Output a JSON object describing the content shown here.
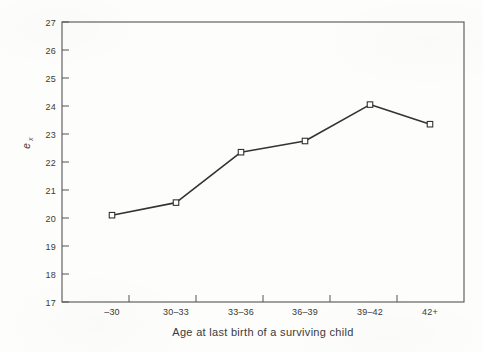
{
  "chart_data": {
    "type": "line",
    "title": "",
    "subtitle": "",
    "xlabel": "Age at last birth of a surviving child",
    "ylabel": "e_x",
    "ylabel_base": "e",
    "ylabel_subscript": "x",
    "categories": [
      "–30",
      "30–33",
      "33–36",
      "36–39",
      "39–42",
      "42+"
    ],
    "values": [
      20.1,
      20.55,
      22.35,
      22.75,
      24.05,
      23.35
    ],
    "series": [
      {
        "name": "e_x",
        "values": [
          20.1,
          20.55,
          22.35,
          22.75,
          24.05,
          23.35
        ]
      }
    ],
    "ylim": [
      17,
      27
    ],
    "yticks": [
      17,
      18,
      19,
      20,
      21,
      22,
      23,
      24,
      25,
      26,
      27
    ],
    "ytick_labels": [
      "17",
      "18",
      "19",
      "20",
      "21",
      "22",
      "23",
      "24",
      "25",
      "26",
      "27"
    ],
    "xtick_labels": [
      "–30",
      "30–33",
      "33–36",
      "36–39",
      "39–42",
      "42+"
    ],
    "grid": false,
    "legend": null,
    "legend_position": "none",
    "marker": "open-square",
    "line_color": "#333333",
    "marker_fill": "#ffffff",
    "marker_edge": "#333333",
    "axis_color": "#555555",
    "plot_background": "#fdfdfc"
  }
}
